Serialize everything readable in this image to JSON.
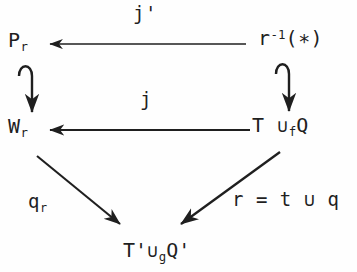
{
  "diagram": {
    "type": "commutative-diagram",
    "background_color": "#fefefe",
    "ink_color": "#1f1f1f",
    "nodes": [
      {
        "id": "pr",
        "base": "P",
        "sub": "r",
        "sup": "",
        "tail": "",
        "position": "top-left"
      },
      {
        "id": "rinv",
        "base": "r",
        "sub": "",
        "sup": "-1",
        "tail": "(∗)",
        "position": "top-right"
      },
      {
        "id": "wr",
        "base": "W",
        "sub": "r",
        "sup": "",
        "tail": "",
        "position": "middle-left"
      },
      {
        "id": "tufq",
        "base": "T",
        "sub": "f",
        "sup": "",
        "tail": "Q",
        "op": "∪",
        "position": "middle-right"
      },
      {
        "id": "tgq",
        "base": "T'",
        "sub": "g",
        "sup": "",
        "tail": "Q'",
        "op": "∪",
        "position": "bottom-center"
      }
    ],
    "edges": [
      {
        "id": "top-horizontal",
        "label": "j'",
        "from": "rinv",
        "to": "pr",
        "style": "plain",
        "direction": "left"
      },
      {
        "id": "middle-horizontal",
        "label": "j",
        "from": "tufq",
        "to": "wr",
        "style": "plain",
        "direction": "left"
      },
      {
        "id": "left-vertical",
        "label": "",
        "from": "pr",
        "to": "wr",
        "style": "hooked",
        "direction": "down"
      },
      {
        "id": "right-vertical",
        "label": "",
        "from": "rinv",
        "to": "tufq",
        "style": "hooked",
        "direction": "down"
      },
      {
        "id": "left-diagonal",
        "label": "q_r",
        "from": "wr",
        "to": "tgq",
        "style": "plain",
        "direction": "down-right"
      },
      {
        "id": "right-diagonal",
        "label": "r = t ∪ q",
        "from": "tufq",
        "to": "tgq",
        "style": "plain",
        "direction": "down-left"
      }
    ],
    "labels": {
      "j_prime": "j'",
      "j": "j",
      "q_r_base": "q",
      "q_r_sub": "r",
      "r_equation": "r = t ∪ q"
    },
    "node_text": {
      "pr_base": "P",
      "pr_sub": "r",
      "rinv_base": "r",
      "rinv_sup": "-1",
      "rinv_tail": "(∗)",
      "wr_base": "W",
      "wr_sub": "r",
      "tufq_base": "T",
      "tufq_op": "∪",
      "tufq_sub": "f",
      "tufq_tail": "Q",
      "tgq_base": "T'",
      "tgq_op": "∪",
      "tgq_sub": "g",
      "tgq_tail": "Q'"
    }
  }
}
